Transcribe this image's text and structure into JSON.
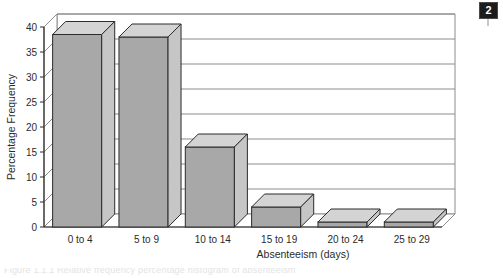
{
  "figure": {
    "badge_label": "2",
    "caption_clipped": "Figure 1.1.1  Relative frequency percentage histogram of absenteeism"
  },
  "chart_data": {
    "type": "bar",
    "title": "",
    "subtitle": "",
    "xlabel": "Absenteeism (days)",
    "ylabel": "Percentage Frequency",
    "categories": [
      "0 to 4",
      "5 to 9",
      "10 to 14",
      "15 to 19",
      "20 to 24",
      "25 to 29"
    ],
    "values": [
      38.5,
      38,
      16,
      4,
      1,
      1
    ],
    "ylim": [
      0,
      40
    ],
    "yticks": [
      0,
      5,
      10,
      15,
      20,
      25,
      30,
      35,
      40
    ],
    "ytick_labels": [
      "0",
      "5",
      "10",
      "15",
      "20",
      "25",
      "30",
      "35",
      "40"
    ],
    "grid": true,
    "legend": false,
    "legend_position": "none",
    "style": "3d-bar",
    "colors": {
      "bar_front": "#a8a8a8",
      "bar_top": "#d4d4d4",
      "bar_side": "#c6c6c6",
      "outline": "#2b2b2b",
      "gridline": "#8c8c8c",
      "axis": "#2b2b2b",
      "background": "#ffffff"
    }
  }
}
